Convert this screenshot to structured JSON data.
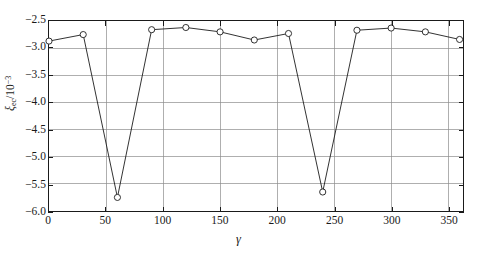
{
  "chart_data": {
    "type": "line",
    "title": "",
    "xlabel": "γ",
    "ylabel": "ξec/10−3",
    "xlim": [
      0,
      363
    ],
    "ylim": [
      -6.0,
      -2.5
    ],
    "grid": true,
    "legend": "none",
    "marker": "open-circle",
    "x": [
      0,
      30,
      60,
      90,
      120,
      150,
      180,
      210,
      240,
      270,
      300,
      330,
      360
    ],
    "values": [
      -2.87,
      -2.75,
      -5.75,
      -2.66,
      -2.62,
      -2.7,
      -2.85,
      -2.73,
      -5.65,
      -2.67,
      -2.63,
      -2.7,
      -2.84
    ],
    "series": [
      {
        "name": "xi_ec",
        "values": [
          -2.87,
          -2.75,
          -5.75,
          -2.66,
          -2.62,
          -2.7,
          -2.85,
          -2.73,
          -5.65,
          -2.67,
          -2.63,
          -2.7,
          -2.84
        ]
      }
    ],
    "xticks": [
      0,
      50,
      100,
      150,
      200,
      250,
      300,
      350
    ],
    "xticklabels": [
      "0",
      "50",
      "100",
      "150",
      "200",
      "250",
      "300",
      "350"
    ],
    "yticks": [
      -2.5,
      -3.0,
      -3.5,
      -4.0,
      -4.5,
      -5.0,
      -5.5,
      -6.0
    ],
    "yticklabels": [
      "−2.5",
      "−3.0",
      "−3.5",
      "−4.0",
      "−4.5",
      "−5.0",
      "−5.5",
      "−6.0"
    ]
  },
  "axis": {
    "ylabel_symbol": "ξ",
    "ylabel_subscript": "ec",
    "ylabel_divider": "/10",
    "ylabel_exponent": "−3",
    "xlabel_symbol": "γ"
  },
  "colors": {
    "line": "#1a1a1a",
    "grid": "#8c8c8c",
    "frame": "#1a1a1a",
    "background": "#ffffff",
    "marker_fill": "#ffffff"
  }
}
